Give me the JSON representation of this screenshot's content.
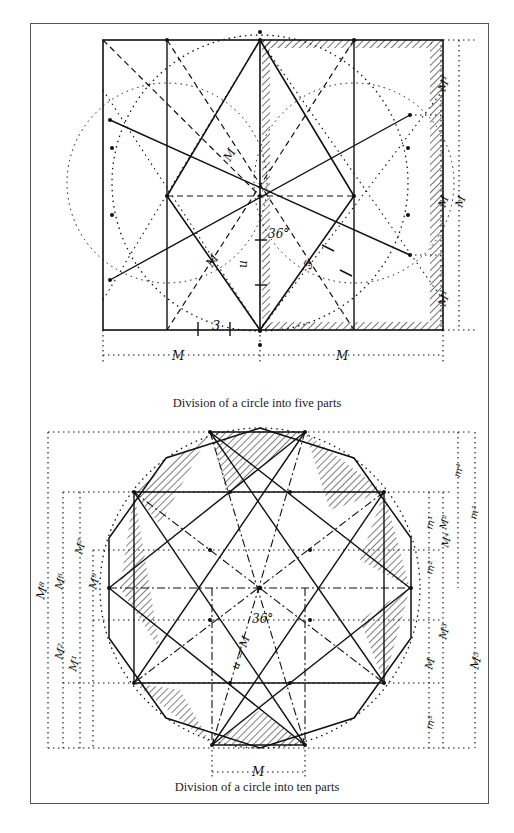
{
  "figures": [
    {
      "id": "five-parts",
      "caption": "Division of a circle into five parts",
      "labels": {
        "angle": "36°",
        "three": "3",
        "five": "5",
        "m_bottom_left": "M",
        "m_bottom_right": "M",
        "m_diag": "M",
        "m_upper": "M",
        "right_m1_top": "M¹",
        "right_m": "M",
        "right_m1_bottom": "M¹",
        "right_m_outer": "M",
        "u_mark": "u"
      }
    },
    {
      "id": "ten-parts",
      "caption": "Division of a circle into ten parts",
      "labels": {
        "angle": "36°",
        "m_center": "u = M",
        "m_bottom": "M",
        "left_m8": "M⁸",
        "left_m6": "M⁶",
        "left_m7": "M⁷",
        "left_m1": "M¹",
        "left_m2": "M²",
        "left_m9": "M⁹",
        "right_m1": "M¹",
        "right_m2": "M²",
        "right_m3": "M³",
        "right_m4": "M⁴",
        "right_m5": "M⁵",
        "right_mm1": "m¹",
        "right_mm2": "m²",
        "right_mm3": "m³",
        "right_mm4": "m⁴",
        "right_mm5": "m⁵",
        "right_m": "M"
      }
    }
  ],
  "colors": {
    "ink": "#111111",
    "frame": "#555555",
    "background": "#ffffff"
  }
}
